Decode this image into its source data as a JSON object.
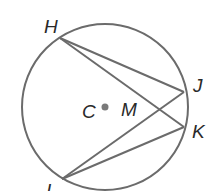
{
  "diagram": {
    "title": "",
    "colors": {
      "stroke": "#6b6b6b",
      "text": "#2a2a2a",
      "center_dot": "#7a7a7a"
    },
    "circle": {
      "center_label": "C",
      "cx": 105,
      "cy": 107,
      "r": 83
    },
    "points": {
      "H": {
        "label": "H",
        "x": 60,
        "y": 38
      },
      "J": {
        "label": "J",
        "x": 184,
        "y": 92
      },
      "K": {
        "label": "K",
        "x": 184,
        "y": 127
      },
      "I": {
        "label": "I",
        "x": 62,
        "y": 179
      },
      "M": {
        "label": "M"
      }
    },
    "segments": [
      "HJ",
      "HK",
      "IJ",
      "IK"
    ]
  }
}
